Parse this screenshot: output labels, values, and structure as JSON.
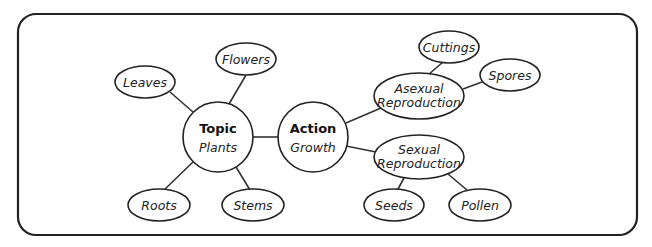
{
  "diagram": {
    "type": "concept-map",
    "frame": {
      "x": 18,
      "y": 14,
      "width": 619,
      "height": 221,
      "radius": 18
    },
    "colors": {
      "stroke": "#222222",
      "fill": "#ffffff",
      "text": "#222222"
    },
    "nodes": {
      "topic": {
        "title": "Topic",
        "subtitle": "Plants",
        "shape": "circle",
        "cx": 218,
        "cy": 137,
        "r": 35
      },
      "action": {
        "title": "Action",
        "subtitle": "Growth",
        "shape": "circle",
        "cx": 313,
        "cy": 137,
        "r": 35
      },
      "leaves": {
        "label": "Leaves",
        "cx": 145,
        "cy": 82,
        "rx": 30,
        "ry": 16
      },
      "flowers": {
        "label": "Flowers",
        "cx": 246,
        "cy": 59,
        "rx": 30,
        "ry": 16
      },
      "roots": {
        "label": "Roots",
        "cx": 159,
        "cy": 205,
        "rx": 31,
        "ry": 16
      },
      "stems": {
        "label": "Stems",
        "cx": 253,
        "cy": 205,
        "rx": 31,
        "ry": 16
      },
      "asexual": {
        "line1": "Asexual",
        "line2": "Reproduction",
        "cx": 419,
        "cy": 96,
        "rx": 45,
        "ry": 23
      },
      "sexual": {
        "line1": "Sexual",
        "line2": "Reproduction",
        "cx": 419,
        "cy": 157,
        "rx": 45,
        "ry": 22
      },
      "cuttings": {
        "label": "Cuttings",
        "cx": 449,
        "cy": 47,
        "rx": 30,
        "ry": 16
      },
      "spores": {
        "label": "Spores",
        "cx": 510,
        "cy": 75,
        "rx": 30,
        "ry": 16
      },
      "seeds": {
        "label": "Seeds",
        "cx": 394,
        "cy": 205,
        "rx": 30,
        "ry": 16
      },
      "pollen": {
        "label": "Pollen",
        "cx": 480,
        "cy": 205,
        "rx": 31,
        "ry": 16
      }
    },
    "edges": [
      [
        "topic",
        "leaves"
      ],
      [
        "topic",
        "flowers"
      ],
      [
        "topic",
        "roots"
      ],
      [
        "topic",
        "stems"
      ],
      [
        "topic",
        "action"
      ],
      [
        "action",
        "asexual"
      ],
      [
        "action",
        "sexual"
      ],
      [
        "asexual",
        "cuttings"
      ],
      [
        "asexual",
        "spores"
      ],
      [
        "sexual",
        "seeds"
      ],
      [
        "sexual",
        "pollen"
      ]
    ]
  }
}
